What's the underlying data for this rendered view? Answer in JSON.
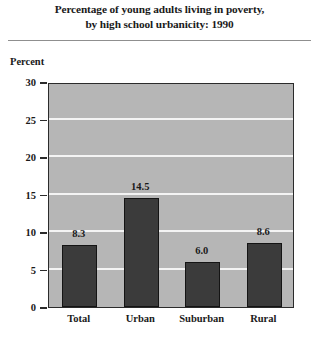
{
  "figure": {
    "title_lines": [
      "Percentage of young adults living in poverty,",
      "by high school urbanicity: 1990"
    ],
    "y_axis_caption": "Percent"
  },
  "chart_data": {
    "type": "bar",
    "title": "Percentage of young adults living in poverty, by high school urbanicity: 1990",
    "xlabel": "",
    "ylabel": "Percent",
    "categories": [
      "Total",
      "Urban",
      "Suburban",
      "Rural"
    ],
    "values": [
      8.3,
      14.5,
      6.0,
      8.6
    ],
    "value_labels": [
      "8.3",
      "14.5",
      "6.0",
      "8.6"
    ],
    "ylim": [
      0,
      30
    ],
    "ytick_values": [
      0,
      5,
      10,
      15,
      20,
      25,
      30
    ],
    "ytick_labels": [
      "0",
      "5",
      "10",
      "15",
      "20",
      "25",
      "30"
    ],
    "grid": true,
    "gridline_values": [
      5,
      10,
      15,
      20,
      25
    ],
    "legend": null,
    "legend_position": "none",
    "colors": {
      "bar_fill": "#3b3b3b",
      "bar_outline": "#141414",
      "plot_background": "#b6b6b6",
      "gridline": "#f4f4f4",
      "axis": "#2b2b2b",
      "text": "#1a1a1a",
      "rule": "#8f8f8f"
    }
  }
}
